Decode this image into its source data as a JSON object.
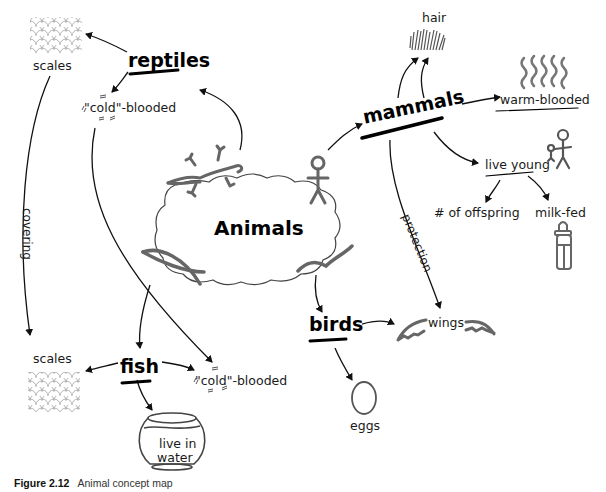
{
  "diagram": {
    "type": "concept-map",
    "hub": "Animals",
    "categories": {
      "reptiles": "reptiles",
      "mammals": "mammals",
      "fish": "fish",
      "birds": "birds"
    },
    "nodes": {
      "reptile_scales": "scales",
      "reptile_cold": "\"cold\"-blooded",
      "hair": "hair",
      "warm_blooded": "warm-blooded",
      "live_young": "live young",
      "offspring": "# of offspring",
      "milk_fed": "milk-fed",
      "fish_scales": "scales",
      "fish_cold": "\"cold\"-blooded",
      "live_in_water_1": "live in",
      "live_in_water_2": "water",
      "wings": "wings",
      "eggs": "eggs"
    },
    "edge_labels": {
      "covering": "covering",
      "protection": "protection"
    },
    "edges": [
      [
        "Animals",
        "reptiles"
      ],
      [
        "Animals",
        "mammals"
      ],
      [
        "Animals",
        "fish"
      ],
      [
        "Animals",
        "birds"
      ],
      [
        "reptiles",
        "scales"
      ],
      [
        "reptiles",
        "cold-blooded"
      ],
      [
        "mammals",
        "hair"
      ],
      [
        "mammals",
        "warm-blooded"
      ],
      [
        "mammals",
        "live young"
      ],
      [
        "mammals",
        "wings (protection)"
      ],
      [
        "live young",
        "# of offspring"
      ],
      [
        "live young",
        "milk-fed"
      ],
      [
        "fish",
        "scales"
      ],
      [
        "fish",
        "cold-blooded"
      ],
      [
        "fish",
        "live in water"
      ],
      [
        "birds",
        "wings"
      ],
      [
        "birds",
        "eggs"
      ],
      [
        "reptile scales",
        "fish scales (covering)"
      ],
      [
        "reptile cold-blooded",
        "fish cold-blooded"
      ]
    ],
    "icons": [
      "lizard-icon",
      "stick-figure-icon",
      "fish-icon",
      "bird-icon",
      "scales-pattern-icon",
      "hair-icon",
      "heat-waves-icon",
      "parent-child-icon",
      "baby-bottle-icon",
      "fishbowl-icon",
      "wing-icon",
      "egg-icon"
    ]
  },
  "caption": {
    "figure": "Figure 2.12",
    "text": "Animal concept map"
  }
}
